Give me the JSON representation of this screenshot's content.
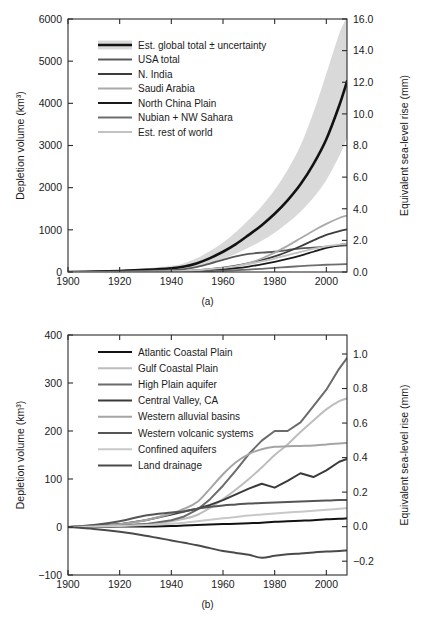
{
  "figure": {
    "panels": [
      {
        "id": "a",
        "caption": "(a)",
        "axes": {
          "xlabel": "",
          "ylabel": "Depletion volume (km³)",
          "y2label": "Equivalent sea-level rise (mm)",
          "xlim": [
            1900,
            2008
          ],
          "ylim": [
            0,
            6000
          ],
          "y2lim": [
            0,
            16.0
          ],
          "xticks": [
            1900,
            1920,
            1940,
            1960,
            1980,
            2000
          ],
          "xticklabels": [
            "1900",
            "1920",
            "1940",
            "1960",
            "1980",
            "2000"
          ],
          "yticks": [
            0,
            1000,
            2000,
            3000,
            4000,
            5000,
            6000
          ],
          "yticklabels": [
            "0",
            "1000",
            "2000",
            "3000",
            "4000",
            "5000",
            "6000"
          ],
          "y2ticks": [
            0.0,
            2.0,
            4.0,
            6.0,
            8.0,
            10.0,
            12.0,
            14.0,
            16.0
          ],
          "y2ticklabels": [
            "0.0",
            "2.0",
            "4.0",
            "6.0",
            "8.0",
            "10.0",
            "12.0",
            "14.0",
            "16.0"
          ],
          "grid": false
        },
        "legend": {
          "position": "upper-left",
          "entries": [
            {
              "label": "Est. global total ± uncertainty",
              "color": "#121212",
              "width": 2.6,
              "band": "#d9d9d9"
            },
            {
              "label": "USA total",
              "color": "#5a5a5a",
              "width": 1.8,
              "band": null
            },
            {
              "label": "N. India",
              "color": "#3d3d3d",
              "width": 1.8,
              "band": null
            },
            {
              "label": "Saudi Arabia",
              "color": "#aaaaaa",
              "width": 1.8,
              "band": null
            },
            {
              "label": "North China Plain",
              "color": "#1a1a1a",
              "width": 1.8,
              "band": null
            },
            {
              "label": "Nubian + NW Sahara",
              "color": "#6e6e6e",
              "width": 1.8,
              "band": null
            },
            {
              "label": "Est. rest of world",
              "color": "#c2c2c2",
              "width": 1.8,
              "band": null
            }
          ]
        },
        "chart_data": {
          "type": "line",
          "title": "",
          "xlabel": "",
          "ylabel": "Depletion volume (km³)",
          "y2label": "Equivalent sea-level rise (mm)",
          "xlim": [
            1900,
            2008
          ],
          "ylim": [
            0,
            6000
          ],
          "x": [
            1900,
            1910,
            1920,
            1930,
            1940,
            1945,
            1950,
            1955,
            1960,
            1965,
            1970,
            1975,
            1980,
            1985,
            1990,
            1995,
            2000,
            2005,
            2008
          ],
          "series": [
            {
              "name": "Est. global total ± uncertainty",
              "color": "#121212",
              "values": [
                0,
                10,
                25,
                50,
                90,
                130,
                210,
                330,
                480,
                660,
                880,
                1110,
                1380,
                1700,
                2080,
                2560,
                3150,
                3950,
                4520
              ],
              "uncertainty_upper": [
                10,
                25,
                50,
                90,
                150,
                210,
                330,
                500,
                700,
                950,
                1240,
                1560,
                1950,
                2420,
                3000,
                3780,
                4700,
                5650,
                6050
              ],
              "uncertainty_lower": [
                0,
                5,
                12,
                25,
                50,
                75,
                130,
                210,
                310,
                430,
                580,
                740,
                930,
                1160,
                1430,
                1760,
                2180,
                2750,
                3180
              ]
            },
            {
              "name": "USA total",
              "color": "#5a5a5a",
              "values": [
                0,
                5,
                12,
                25,
                45,
                70,
                120,
                200,
                290,
                370,
                430,
                460,
                480,
                520,
                560,
                580,
                600,
                620,
                630
              ]
            },
            {
              "name": "N. India",
              "color": "#3d3d3d",
              "values": [
                0,
                2,
                5,
                10,
                18,
                28,
                45,
                70,
                105,
                150,
                210,
                280,
                370,
                480,
                610,
                750,
                880,
                970,
                1010
              ]
            },
            {
              "name": "Saudi Arabia",
              "color": "#aaaaaa",
              "values": [
                0,
                1,
                2,
                4,
                7,
                11,
                20,
                40,
                75,
                130,
                210,
                320,
                460,
                620,
                800,
                980,
                1140,
                1280,
                1340
              ]
            },
            {
              "name": "North China Plain",
              "color": "#1a1a1a",
              "values": [
                0,
                1,
                2,
                4,
                8,
                13,
                22,
                38,
                60,
                90,
                130,
                180,
                240,
                310,
                390,
                480,
                570,
                640,
                670
              ]
            },
            {
              "name": "Nubian + NW Sahara",
              "color": "#6e6e6e",
              "values": [
                0,
                1,
                2,
                3,
                5,
                8,
                13,
                20,
                30,
                42,
                58,
                76,
                96,
                118,
                140,
                158,
                172,
                182,
                186
              ]
            },
            {
              "name": "Est. rest of world",
              "color": "#c2c2c2",
              "values": [
                0,
                2,
                5,
                10,
                18,
                28,
                45,
                70,
                100,
                140,
                190,
                250,
                320,
                400,
                480,
                550,
                610,
                650,
                670
              ]
            }
          ]
        }
      },
      {
        "id": "b",
        "caption": "(b)",
        "axes": {
          "xlabel": "",
          "ylabel": "Depletion volume (km³)",
          "y2label": "Equivalent sea-level rise (mm)",
          "xlim": [
            1900,
            2008
          ],
          "ylim": [
            -100,
            400
          ],
          "y2lim": [
            -0.28,
            1.11
          ],
          "xticks": [
            1900,
            1920,
            1940,
            1960,
            1980,
            2000
          ],
          "xticklabels": [
            "1900",
            "1920",
            "1940",
            "1960",
            "1980",
            "2000"
          ],
          "yticks": [
            -100,
            0,
            100,
            200,
            300,
            400
          ],
          "yticklabels": [
            "−100",
            "0",
            "100",
            "200",
            "300",
            "400"
          ],
          "y2ticks": [
            -0.2,
            0.0,
            0.2,
            0.4,
            0.6,
            0.8,
            1.0
          ],
          "y2ticklabels": [
            "−0.2",
            "0.0",
            "0.2",
            "0.4",
            "0.6",
            "0.8",
            "1.0"
          ],
          "grid": false
        },
        "legend": {
          "position": "upper-left",
          "entries": [
            {
              "label": "Atlantic Coastal Plain",
              "color": "#121212",
              "width": 2.0
            },
            {
              "label": "Gulf Coastal Plain",
              "color": "#bdbdbd",
              "width": 2.0
            },
            {
              "label": "High Plain aquifer",
              "color": "#6b6b6b",
              "width": 2.0
            },
            {
              "label": "Central Valley, CA",
              "color": "#3a3a3a",
              "width": 2.0
            },
            {
              "label": "Western alluvial basins",
              "color": "#a5a5a5",
              "width": 2.0
            },
            {
              "label": "Western volcanic systems",
              "color": "#555555",
              "width": 2.0
            },
            {
              "label": "Confined aquifers",
              "color": "#c8c8c8",
              "width": 2.0
            },
            {
              "label": "Land drainage",
              "color": "#4a4a4a",
              "width": 2.0
            }
          ]
        },
        "chart_data": {
          "type": "line",
          "title": "",
          "xlabel": "",
          "ylabel": "Depletion volume (km³)",
          "y2label": "Equivalent sea-level rise (mm)",
          "xlim": [
            1900,
            2008
          ],
          "ylim": [
            -100,
            400
          ],
          "x": [
            1900,
            1910,
            1920,
            1930,
            1940,
            1945,
            1950,
            1955,
            1960,
            1965,
            1970,
            1975,
            1980,
            1985,
            1990,
            1995,
            2000,
            2005,
            2008
          ],
          "series": [
            {
              "name": "Atlantic Coastal Plain",
              "color": "#121212",
              "values": [
                0,
                0,
                1,
                1,
                2,
                3,
                4,
                5,
                6,
                7,
                8,
                9,
                11,
                12,
                13,
                14,
                16,
                17,
                18
              ]
            },
            {
              "name": "Gulf Coastal Plain",
              "color": "#bdbdbd",
              "values": [
                0,
                1,
                3,
                6,
                12,
                17,
                25,
                40,
                58,
                78,
                100,
                124,
                150,
                172,
                198,
                222,
                245,
                262,
                268
              ]
            },
            {
              "name": "High Plain aquifer",
              "color": "#6b6b6b",
              "values": [
                0,
                1,
                3,
                6,
                14,
                22,
                36,
                58,
                86,
                118,
                152,
                180,
                200,
                200,
                218,
                252,
                286,
                330,
                352
              ]
            },
            {
              "name": "Central Valley, CA",
              "color": "#3a3a3a",
              "values": [
                0,
                2,
                6,
                14,
                26,
                32,
                38,
                46,
                56,
                68,
                80,
                90,
                82,
                96,
                112,
                104,
                118,
                136,
                142
              ]
            },
            {
              "name": "Western alluvial basins",
              "color": "#a5a5a5",
              "values": [
                0,
                2,
                6,
                14,
                28,
                38,
                52,
                80,
                110,
                135,
                152,
                162,
                167,
                168,
                169,
                170,
                172,
                174,
                175
              ]
            },
            {
              "name": "Western volcanic systems",
              "color": "#555555",
              "values": [
                0,
                4,
                12,
                24,
                30,
                33,
                38,
                42,
                45,
                47,
                49,
                50,
                51,
                52,
                53,
                54,
                55,
                56,
                56
              ]
            },
            {
              "name": "Confined aquifers",
              "color": "#c8c8c8",
              "values": [
                0,
                1,
                2,
                4,
                7,
                9,
                12,
                15,
                18,
                21,
                24,
                26,
                28,
                30,
                32,
                34,
                36,
                38,
                39
              ]
            },
            {
              "name": "Land drainage",
              "color": "#4a4a4a",
              "values": [
                0,
                -4,
                -10,
                -18,
                -28,
                -33,
                -38,
                -44,
                -50,
                -54,
                -58,
                -64,
                -60,
                -57,
                -55,
                -53,
                -51,
                -50,
                -49
              ]
            }
          ]
        }
      }
    ]
  }
}
